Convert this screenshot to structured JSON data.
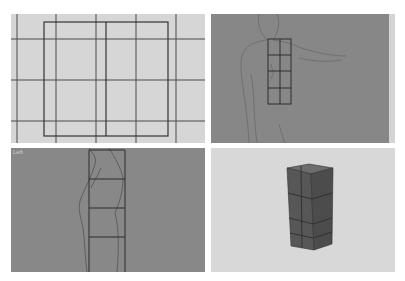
{
  "viewports": [
    {
      "id": "top-left",
      "view": "grid-front",
      "background": "#d6d6d6"
    },
    {
      "id": "top-right",
      "view": "reference-front-body",
      "background": "#878787"
    },
    {
      "id": "bottom-left",
      "view": "reference-side-body",
      "background": "#888888",
      "label": "Left"
    },
    {
      "id": "bottom-right",
      "view": "perspective-box-stack",
      "background": "#d8d8d8"
    }
  ],
  "box_segments": {
    "columns": 2,
    "rows": 4
  },
  "colors": {
    "grid_line": "#444444",
    "box_face": "#5a5a5a",
    "box_side": "#4a4a4a",
    "box_top": "#6a6a6a"
  }
}
